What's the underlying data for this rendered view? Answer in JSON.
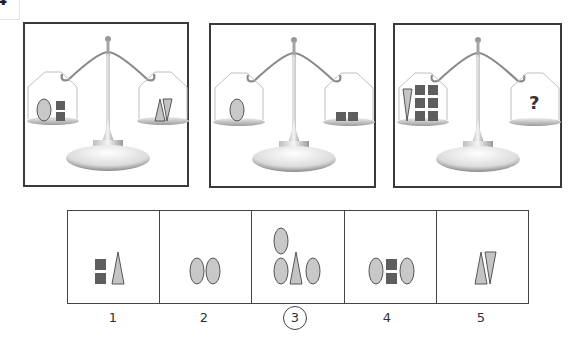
{
  "problem_number": "4",
  "colors": {
    "oval_fill": "#c8c8c8",
    "triangle_fill": "#c4c4c4",
    "square_fill": "#5e5e5e",
    "outline": "#555555",
    "border": "#3a3a3a"
  },
  "scales": [
    {
      "id": "scale-1",
      "left_pan": [
        "oval",
        "square",
        "square"
      ],
      "right_pan": [
        "triangle-up",
        "triangle-down"
      ]
    },
    {
      "id": "scale-2",
      "left_pan": [
        "oval"
      ],
      "right_pan": [
        "square",
        "square"
      ]
    },
    {
      "id": "scale-3",
      "left_pan": [
        "triangle-down",
        "square",
        "square",
        "square",
        "square",
        "square",
        "square"
      ],
      "right_pan": [
        "?"
      ]
    }
  ],
  "unknown_symbol": "?",
  "options": [
    {
      "label": "1",
      "contents": [
        "square",
        "square",
        "triangle-up"
      ],
      "selected": false
    },
    {
      "label": "2",
      "contents": [
        "oval",
        "oval"
      ],
      "selected": false
    },
    {
      "label": "3",
      "contents": [
        "oval",
        "oval",
        "triangle-up",
        "oval"
      ],
      "selected": true
    },
    {
      "label": "4",
      "contents": [
        "oval",
        "square",
        "square",
        "oval"
      ],
      "selected": false
    },
    {
      "label": "5",
      "contents": [
        "triangle-up",
        "triangle-down"
      ],
      "selected": false
    }
  ]
}
